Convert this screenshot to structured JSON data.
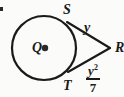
{
  "figure": {
    "type": "geometry-diagram",
    "background_color": "#fbfbf9",
    "stroke_color": "#1a1a1a",
    "stroke_width": 2,
    "labels": {
      "center": "Q",
      "tangent_point_top": "S",
      "tangent_point_bottom": "T",
      "external_point": "R",
      "tangent_length_top": "y"
    },
    "fraction_label": {
      "numerator_base": "y",
      "numerator_exponent": "2",
      "denominator": "7"
    },
    "circle": {
      "center_x": 44,
      "center_y": 48,
      "radius": 32
    },
    "center_dot": {
      "x": 45,
      "y": 48,
      "radius": 3
    },
    "external_point": {
      "x": 110,
      "y": 48
    },
    "tangent_point_top": {
      "x": 67,
      "y": 22
    },
    "tangent_point_bottom": {
      "x": 68,
      "y": 72
    }
  }
}
